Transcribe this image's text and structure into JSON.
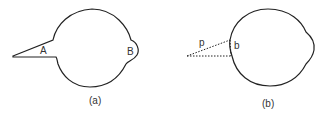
{
  "figure_a": {
    "label_A": "A",
    "label_B": "B",
    "caption": "(a)"
  },
  "figure_b": {
    "label_p": "p",
    "label_b": "b",
    "caption": "(b)"
  },
  "colors": {
    "stroke": "#222222"
  }
}
